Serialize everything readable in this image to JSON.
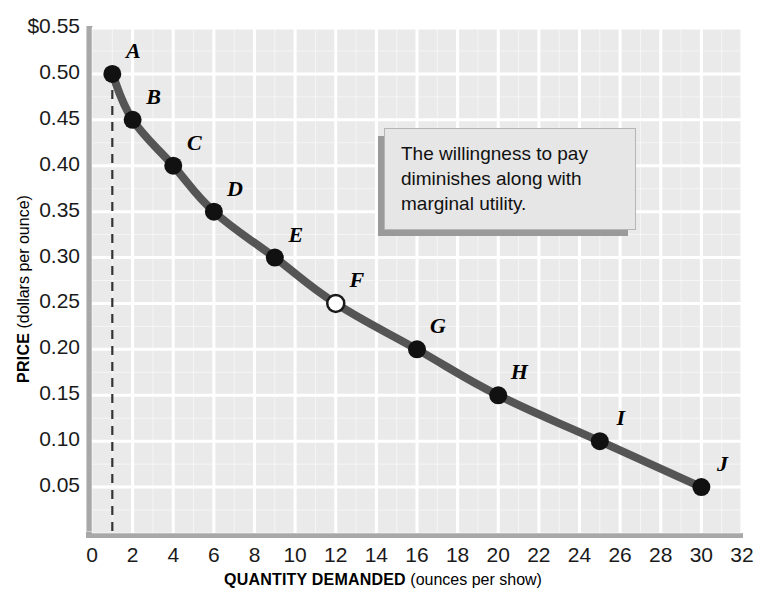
{
  "chart_data": {
    "type": "line",
    "title": "",
    "xlabel_strong": "QUANTITY DEMANDED",
    "xlabel_rest": " (ounces per show)",
    "ylabel_strong": "PRICE",
    "ylabel_rest": " (dollars per ounce)",
    "xlim": [
      0,
      32
    ],
    "ylim": [
      0,
      0.55
    ],
    "grid": true,
    "legend": "none",
    "x_ticks": [
      "0",
      "2",
      "4",
      "6",
      "8",
      "10",
      "12",
      "14",
      "16",
      "18",
      "20",
      "22",
      "24",
      "26",
      "28",
      "30",
      "32"
    ],
    "x_tick_values": [
      0,
      2,
      4,
      6,
      8,
      10,
      12,
      14,
      16,
      18,
      20,
      22,
      24,
      26,
      28,
      30,
      32
    ],
    "y_ticks": [
      "$0.55",
      "0.50",
      "0.45",
      "0.40",
      "0.35",
      "0.30",
      "0.25",
      "0.20",
      "0.15",
      "0.10",
      "0.05"
    ],
    "y_tick_values": [
      0.55,
      0.5,
      0.45,
      0.4,
      0.35,
      0.3,
      0.25,
      0.2,
      0.15,
      0.1,
      0.05
    ],
    "series": [
      {
        "name": "Demand",
        "x": [
          1,
          2,
          4,
          6,
          9,
          12,
          16,
          20,
          25,
          30
        ],
        "values": [
          0.5,
          0.45,
          0.4,
          0.35,
          0.3,
          0.25,
          0.2,
          0.15,
          0.1,
          0.05
        ],
        "point_labels": [
          "A",
          "B",
          "C",
          "D",
          "E",
          "F",
          "G",
          "H",
          "I",
          "J"
        ],
        "point_styles": [
          "filled",
          "filled",
          "filled",
          "filled",
          "filled",
          "hollow",
          "filled",
          "filled",
          "filled",
          "filled"
        ],
        "color": "#555555"
      }
    ],
    "points": [
      {
        "label": "A",
        "quantity": 1,
        "price": 0.5,
        "style": "filled"
      },
      {
        "label": "B",
        "quantity": 2,
        "price": 0.45,
        "style": "filled"
      },
      {
        "label": "C",
        "quantity": 4,
        "price": 0.4,
        "style": "filled"
      },
      {
        "label": "D",
        "quantity": 6,
        "price": 0.35,
        "style": "filled"
      },
      {
        "label": "E",
        "quantity": 9,
        "price": 0.3,
        "style": "filled"
      },
      {
        "label": "F",
        "quantity": 12,
        "price": 0.25,
        "style": "hollow"
      },
      {
        "label": "G",
        "quantity": 16,
        "price": 0.2,
        "style": "filled"
      },
      {
        "label": "H",
        "quantity": 20,
        "price": 0.15,
        "style": "filled"
      },
      {
        "label": "I",
        "quantity": 25,
        "price": 0.1,
        "style": "filled"
      },
      {
        "label": "J",
        "quantity": 30,
        "price": 0.05,
        "style": "filled"
      }
    ],
    "annotations": [
      {
        "text": "The willingness to pay diminishes along with marginal utility."
      }
    ],
    "guide_lines": [
      {
        "type": "vertical-dashed",
        "at_quantity": 1,
        "from_price": 0.0,
        "to_price": 0.5
      }
    ],
    "colors": {
      "plot_background": "#eaeaea",
      "gridline": "#ffffff",
      "curve": "#555555",
      "axis_rail": "#a8a8a8",
      "text": "#111111",
      "annotation_background": "#e6e6e6",
      "annotation_shadow": "#9a9a9a"
    }
  }
}
